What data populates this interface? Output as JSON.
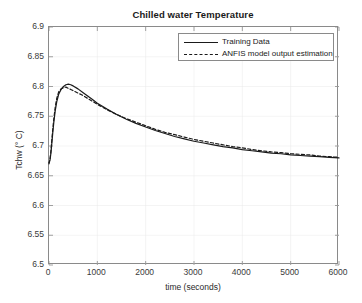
{
  "chart_data": {
    "type": "line",
    "title": "Chilled water Temperature",
    "xlabel": "time (seconds)",
    "ylabel": "Tchw (° C)",
    "xlim": [
      0,
      6000
    ],
    "ylim": [
      6.5,
      6.9
    ],
    "xticks": [
      0,
      1000,
      2000,
      3000,
      4000,
      5000,
      6000
    ],
    "xtick_labels": [
      "0",
      "1000",
      "2000",
      "3000",
      "4000",
      "5000",
      "6000"
    ],
    "yticks": [
      6.5,
      6.55,
      6.6,
      6.65,
      6.7,
      6.75,
      6.8,
      6.85,
      6.9
    ],
    "ytick_labels": [
      "6.5",
      "6.55",
      "6.6",
      "6.65",
      "6.7",
      "6.75",
      "6.8",
      "6.85",
      "6.9"
    ],
    "grid": true,
    "legend_position": "top-right",
    "line_color": "#1a1a1a",
    "axis_color": "#8a8a8a",
    "grid_color": "#e8e8e8",
    "legend": [
      {
        "name": "Training Data",
        "style": "solid"
      },
      {
        "name": "ANFIS model output estimation",
        "style": "dashed"
      }
    ],
    "series": [
      {
        "name": "Training Data",
        "style": "solid",
        "x": [
          0,
          20,
          40,
          60,
          80,
          100,
          130,
          160,
          200,
          250,
          300,
          350,
          400,
          450,
          500,
          600,
          700,
          800,
          900,
          1000,
          1200,
          1400,
          1600,
          1800,
          2000,
          2200,
          2400,
          2600,
          2800,
          3000,
          3200,
          3400,
          3600,
          3800,
          4000,
          4200,
          4400,
          4600,
          4800,
          5000,
          5200,
          5400,
          5600,
          5800,
          6000
        ],
        "y": [
          6.672,
          6.676,
          6.688,
          6.706,
          6.724,
          6.74,
          6.76,
          6.774,
          6.787,
          6.795,
          6.8,
          6.803,
          6.804,
          6.803,
          6.801,
          6.796,
          6.79,
          6.784,
          6.778,
          6.772,
          6.762,
          6.753,
          6.745,
          6.738,
          6.732,
          6.726,
          6.721,
          6.716,
          6.712,
          6.708,
          6.705,
          6.702,
          6.699,
          6.697,
          6.694,
          6.692,
          6.69,
          6.688,
          6.687,
          6.685,
          6.684,
          6.683,
          6.682,
          6.681,
          6.68
        ]
      },
      {
        "name": "ANFIS model output estimation",
        "style": "dashed",
        "x": [
          0,
          20,
          40,
          60,
          80,
          100,
          130,
          160,
          200,
          250,
          300,
          350,
          400,
          450,
          500,
          600,
          700,
          800,
          900,
          1000,
          1200,
          1400,
          1600,
          1800,
          2000,
          2200,
          2400,
          2600,
          2800,
          3000,
          3200,
          3400,
          3600,
          3800,
          4000,
          4200,
          4400,
          4600,
          4800,
          5000,
          5200,
          5400,
          5600,
          5800,
          6000
        ],
        "y": [
          6.67,
          6.678,
          6.692,
          6.712,
          6.73,
          6.746,
          6.766,
          6.78,
          6.791,
          6.796,
          6.798,
          6.799,
          6.797,
          6.795,
          6.793,
          6.789,
          6.785,
          6.78,
          6.775,
          6.77,
          6.761,
          6.753,
          6.746,
          6.74,
          6.734,
          6.728,
          6.723,
          6.719,
          6.715,
          6.711,
          6.708,
          6.705,
          6.702,
          6.699,
          6.697,
          6.694,
          6.692,
          6.69,
          6.689,
          6.687,
          6.686,
          6.685,
          6.683,
          6.682,
          6.681
        ]
      }
    ]
  }
}
